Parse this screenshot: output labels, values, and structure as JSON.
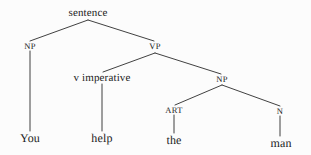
{
  "figure": {
    "sentence": "You help the man",
    "background_color": "#fcfcfc",
    "line_color": "#2b2b2b",
    "text_color": "#1b1b1b"
  },
  "nodes": [
    {
      "id": "root",
      "label": "sentence",
      "x": 88,
      "y": 13,
      "kind": "root"
    },
    {
      "id": "np1",
      "label": "NP",
      "x": 30,
      "y": 46,
      "kind": "category"
    },
    {
      "id": "vp",
      "label": "VP",
      "x": 155,
      "y": 46,
      "kind": "category"
    },
    {
      "id": "v-imp",
      "label": "v imperative",
      "x": 102,
      "y": 78,
      "kind": "phrase"
    },
    {
      "id": "np2",
      "label": "NP",
      "x": 222,
      "y": 79,
      "kind": "category"
    },
    {
      "id": "art",
      "label": "ART",
      "x": 174,
      "y": 110,
      "kind": "category"
    },
    {
      "id": "n",
      "label": "N",
      "x": 280,
      "y": 111,
      "kind": "category"
    },
    {
      "id": "leaf-you",
      "label": "You",
      "x": 30,
      "y": 138,
      "kind": "leaf"
    },
    {
      "id": "leaf-help",
      "label": "help",
      "x": 102,
      "y": 138,
      "kind": "leaf"
    },
    {
      "id": "leaf-the",
      "label": "the",
      "x": 174,
      "y": 140,
      "kind": "leaf"
    },
    {
      "id": "leaf-man",
      "label": "man",
      "x": 281,
      "y": 143,
      "kind": "leaf"
    }
  ],
  "edges": [
    {
      "id": "edge-root-np1",
      "from": "root",
      "to": "np1",
      "x1": 88,
      "y1": 20,
      "x2": 30,
      "y2": 41
    },
    {
      "id": "edge-root-vp",
      "from": "root",
      "to": "vp",
      "x1": 88,
      "y1": 20,
      "x2": 154,
      "y2": 41
    },
    {
      "id": "edge-np1-you",
      "from": "np1",
      "to": "leaf-you",
      "x1": 30,
      "y1": 51,
      "x2": 30,
      "y2": 131
    },
    {
      "id": "edge-vp-vimp",
      "from": "vp",
      "to": "v-imp",
      "x1": 155,
      "y1": 53,
      "x2": 103,
      "y2": 72
    },
    {
      "id": "edge-vp-np2",
      "from": "vp",
      "to": "np2",
      "x1": 155,
      "y1": 53,
      "x2": 221,
      "y2": 74
    },
    {
      "id": "edge-vimp-help",
      "from": "v-imp",
      "to": "leaf-help",
      "x1": 102,
      "y1": 84,
      "x2": 102,
      "y2": 131
    },
    {
      "id": "edge-np2-art",
      "from": "np2",
      "to": "art",
      "x1": 222,
      "y1": 85,
      "x2": 175,
      "y2": 105
    },
    {
      "id": "edge-np2-n",
      "from": "np2",
      "to": "n",
      "x1": 222,
      "y1": 85,
      "x2": 280,
      "y2": 106
    },
    {
      "id": "edge-art-the",
      "from": "art",
      "to": "leaf-the",
      "x1": 174,
      "y1": 115,
      "x2": 174,
      "y2": 133
    },
    {
      "id": "edge-n-man",
      "from": "n",
      "to": "leaf-man",
      "x1": 280,
      "y1": 116,
      "x2": 280,
      "y2": 136
    }
  ]
}
